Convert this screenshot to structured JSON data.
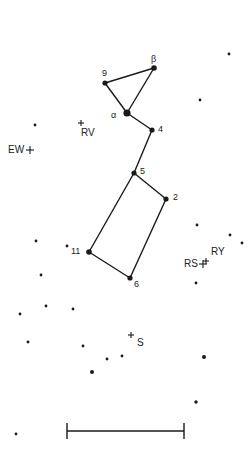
{
  "chart_data": {
    "type": "diagram",
    "title": "",
    "colors": {
      "ink": "#1a1a1a",
      "label": "#222222",
      "background": "#ffffff"
    },
    "labeled_stars": [
      {
        "id": "beta",
        "label": "β",
        "x": 154,
        "y": 68,
        "r": 2.8,
        "label_dx": -3,
        "label_dy": -13
      },
      {
        "id": "9",
        "label": "9",
        "x": 105,
        "y": 83,
        "r": 2.6,
        "label_dx": -3,
        "label_dy": -14
      },
      {
        "id": "alpha",
        "label": "α",
        "x": 127,
        "y": 113,
        "r": 3.6,
        "label_dx": -16,
        "label_dy": -2
      },
      {
        "id": "4",
        "label": "4",
        "x": 152,
        "y": 130,
        "r": 2.6,
        "label_dx": 6,
        "label_dy": -5
      },
      {
        "id": "5",
        "label": "5",
        "x": 134,
        "y": 173,
        "r": 2.6,
        "label_dx": 6,
        "label_dy": -6
      },
      {
        "id": "2",
        "label": "2",
        "x": 166,
        "y": 199,
        "r": 2.6,
        "label_dx": 7,
        "label_dy": -6
      },
      {
        "id": "11",
        "label": "11",
        "x": 89,
        "y": 252,
        "r": 2.8,
        "label_dx": -18,
        "label_dy": -5
      },
      {
        "id": "6",
        "label": "6",
        "x": 130,
        "y": 278,
        "r": 2.6,
        "label_dx": 4,
        "label_dy": 2
      }
    ],
    "asterism_lines": [
      [
        "9",
        "beta"
      ],
      [
        "9",
        "alpha"
      ],
      [
        "alpha",
        "beta"
      ],
      [
        "alpha",
        "4"
      ],
      [
        "4",
        "5"
      ],
      [
        "5",
        "2"
      ],
      [
        "5",
        "11"
      ],
      [
        "2",
        "6"
      ],
      [
        "11",
        "6"
      ]
    ],
    "variable_stars": [
      {
        "label": "RV",
        "x": 81,
        "y": 123,
        "size": 3,
        "label_dx": 0,
        "label_dy": 5
      },
      {
        "label": "EW",
        "x": 30,
        "y": 150,
        "size": 4,
        "label_dx": -22,
        "label_dy": -5
      },
      {
        "label": "RY",
        "x": 206,
        "y": 261,
        "size": 3,
        "label_dx": 5,
        "label_dy": -14
      },
      {
        "label": "RS",
        "x": 203,
        "y": 264,
        "size": 4,
        "label_dx": -19,
        "label_dy": -5
      },
      {
        "label": "S",
        "x": 131,
        "y": 335,
        "size": 3,
        "label_dx": 6,
        "label_dy": 3
      }
    ],
    "field_stars": [
      {
        "x": 229,
        "y": 54,
        "r": 1.4
      },
      {
        "x": 200,
        "y": 100,
        "r": 1.4
      },
      {
        "x": 35,
        "y": 125,
        "r": 1.4
      },
      {
        "x": 197,
        "y": 225,
        "r": 1.4
      },
      {
        "x": 230,
        "y": 235,
        "r": 1.4
      },
      {
        "x": 242,
        "y": 243,
        "r": 1.4
      },
      {
        "x": 36,
        "y": 241,
        "r": 1.4
      },
      {
        "x": 67,
        "y": 246,
        "r": 1.4
      },
      {
        "x": 41,
        "y": 275,
        "r": 1.4
      },
      {
        "x": 196,
        "y": 283,
        "r": 1.4
      },
      {
        "x": 46,
        "y": 306,
        "r": 1.4
      },
      {
        "x": 20,
        "y": 314,
        "r": 1.4
      },
      {
        "x": 73,
        "y": 309,
        "r": 1.4
      },
      {
        "x": 28,
        "y": 342,
        "r": 1.4
      },
      {
        "x": 83,
        "y": 346,
        "r": 1.4
      },
      {
        "x": 107,
        "y": 359,
        "r": 1.4
      },
      {
        "x": 122,
        "y": 356,
        "r": 1.4
      },
      {
        "x": 92,
        "y": 372,
        "r": 2.0
      },
      {
        "x": 204,
        "y": 357,
        "r": 2.0
      },
      {
        "x": 196,
        "y": 402,
        "r": 1.7
      },
      {
        "x": 16,
        "y": 434,
        "r": 1.4
      }
    ],
    "scale_bar": {
      "x1": 67,
      "x2": 184,
      "y": 431,
      "tick_half": 8,
      "label": ""
    }
  }
}
